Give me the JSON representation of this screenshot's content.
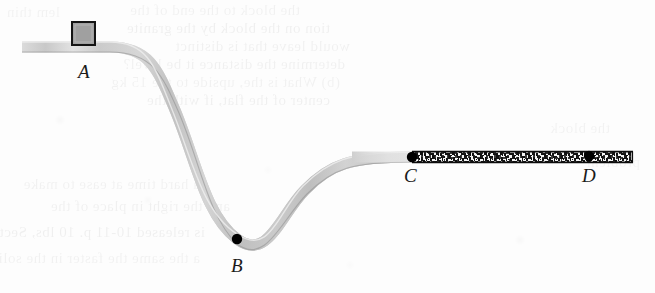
{
  "figure": {
    "width": 655,
    "height": 293,
    "background_color": "#fdfdfd"
  },
  "colors": {
    "track_gray": "#c9c9c9",
    "track_gray_light": "#e2e2e2",
    "track_gray_dark": "#b0b0b0",
    "rough_dark": "#1c1c1c",
    "marker_black": "#000000",
    "block_fill": "#a0a0a0",
    "block_stroke": "#141414",
    "label_color": "#1a1a1a"
  },
  "labels": [
    {
      "id": "A",
      "text": "A",
      "x": 78,
      "y": 62,
      "description": "top of the smooth elevated track where the block starts"
    },
    {
      "id": "B",
      "text": "B",
      "x": 231,
      "y": 256,
      "description": "lowest point of the valley"
    },
    {
      "id": "C",
      "text": "C",
      "x": 404,
      "y": 166,
      "description": "start of the rough horizontal section"
    },
    {
      "id": "D",
      "text": "D",
      "x": 582,
      "y": 166,
      "description": "end point on the rough horizontal section"
    }
  ],
  "markers": [
    {
      "id": "B",
      "cx": 237,
      "cy": 239,
      "r": 5.2
    },
    {
      "id": "C",
      "cx": 412,
      "cy": 157,
      "r": 5.2
    },
    {
      "id": "D",
      "cx": 589,
      "cy": 156,
      "r": 5.2
    }
  ],
  "block": {
    "name": "sliding block",
    "x": 72,
    "y": 22,
    "width": 23,
    "height": 23,
    "fill": "#a0a0a0",
    "stroke": "#141414",
    "stroke_width": 2
  },
  "track": {
    "thickness": 11,
    "smooth_path": "M 22,47 L 110,47 C 150,47 158,70 175,110 C 196,160 205,215 237,239 C 268,262 280,215 305,190 C 330,164 350,157 412,157",
    "rough_segment": {
      "x_start": 412,
      "x_end": 633,
      "y": 157,
      "thickness": 11,
      "label": "rough (friction) surface between C and D"
    },
    "segments": [
      {
        "from": "start",
        "to": "A",
        "type": "horizontal-smooth"
      },
      {
        "from": "A",
        "to": "B",
        "type": "curved-smooth-descent"
      },
      {
        "from": "B",
        "to": "C",
        "type": "curved-smooth-ascent"
      },
      {
        "from": "C",
        "to": "D",
        "type": "horizontal-rough"
      }
    ]
  },
  "ghost_text": {
    "description": "faint show-through text from the reverse side of the scanned page",
    "lines": [
      {
        "text": "the block to the end of the",
        "x": 300,
        "y": 2,
        "size": 15,
        "opacity": 0.045
      },
      {
        "text": "tion on the block by the granite",
        "x": 330,
        "y": 20,
        "size": 15,
        "opacity": 0.05
      },
      {
        "text": "would leave that is distinct",
        "x": 350,
        "y": 38,
        "size": 15,
        "opacity": 0.048
      },
      {
        "text": "determine the distance it be level?",
        "x": 345,
        "y": 56,
        "size": 15,
        "opacity": 0.046
      },
      {
        "text": "(b) What is the, upside to the 15 kg",
        "x": 340,
        "y": 74,
        "size": 15,
        "opacity": 0.044
      },
      {
        "text": "center of the flat, if with the",
        "x": 330,
        "y": 92,
        "size": 15,
        "opacity": 0.05
      },
      {
        "text": "the block",
        "x": 610,
        "y": 120,
        "size": 15,
        "opacity": 0.038
      },
      {
        "text": "a hard time at ease to make",
        "x": 200,
        "y": 176,
        "size": 15,
        "opacity": 0.044
      },
      {
        "text": "and the right in place of the",
        "x": 230,
        "y": 198,
        "size": 15,
        "opacity": 0.046
      },
      {
        "text": "is released 10-11 p. 10 lbs, Section",
        "x": 205,
        "y": 224,
        "size": 15,
        "opacity": 0.05
      },
      {
        "text": "a the same the faster in the solid",
        "x": 200,
        "y": 250,
        "size": 15,
        "opacity": 0.042
      },
      {
        "text": "lem  thin",
        "x": 60,
        "y": 4,
        "size": 15,
        "opacity": 0.04
      },
      {
        "text": "problem",
        "x": 640,
        "y": 154,
        "size": 15,
        "opacity": 0.036
      }
    ]
  },
  "scan_artifacts": {
    "description": "light blur / speckle spots from the page scan",
    "spots": [
      {
        "x": 148,
        "y": 200,
        "r": 2,
        "opacity": 0.05
      },
      {
        "x": 268,
        "y": 170,
        "r": 2,
        "opacity": 0.04
      },
      {
        "x": 60,
        "y": 120,
        "r": 3,
        "opacity": 0.03
      },
      {
        "x": 520,
        "y": 240,
        "r": 3,
        "opacity": 0.03
      },
      {
        "x": 350,
        "y": 265,
        "r": 2,
        "opacity": 0.04
      }
    ]
  }
}
